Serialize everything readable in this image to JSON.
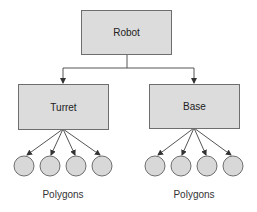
{
  "diagram": {
    "root": {
      "label": "Robot"
    },
    "children": [
      {
        "label": "Turret",
        "leaves": 4,
        "leaf_label": "Polygons"
      },
      {
        "label": "Base",
        "leaves": 4,
        "leaf_label": "Polygons"
      }
    ]
  },
  "colors": {
    "box_fill": "#dcdcdc",
    "box_border": "#6e6e6e",
    "line": "#555555",
    "circle_fill": "#d8d8d8",
    "circle_border": "#6e6e6e"
  }
}
